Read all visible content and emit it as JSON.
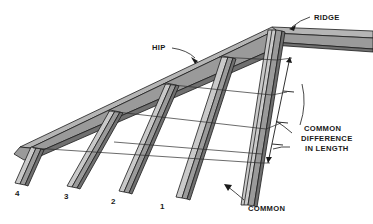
{
  "figure": {
    "background_color": "#ffffff",
    "line_color": "#1c1c1c",
    "timber_fill": "#9a9a9a",
    "timber_top_fill": "#b5b5b5",
    "timber_dark_fill": "#707070"
  },
  "labels": {
    "ridge": "RIDGE",
    "hip": "HIP",
    "common": "COMMON",
    "common_difference_line1": "COMMON",
    "common_difference_line2": "DIFFERENCE",
    "common_difference_line3": "IN LENGTH"
  },
  "jack_rafter_numbers": [
    "4",
    "3",
    "2",
    "1"
  ],
  "members": [
    {
      "name": "ridge-beam",
      "label": "RIDGE"
    },
    {
      "name": "hip-rafter",
      "label": "HIP"
    },
    {
      "name": "common-rafter",
      "label": "COMMON"
    },
    {
      "name": "jack-rafter-4",
      "label": "4"
    },
    {
      "name": "jack-rafter-3",
      "label": "3"
    },
    {
      "name": "jack-rafter-2",
      "label": "2"
    },
    {
      "name": "jack-rafter-1",
      "label": "1"
    }
  ],
  "dimension": {
    "name": "common-difference-dimension",
    "tick_count": 4,
    "note": "COMMON DIFFERENCE IN LENGTH"
  }
}
